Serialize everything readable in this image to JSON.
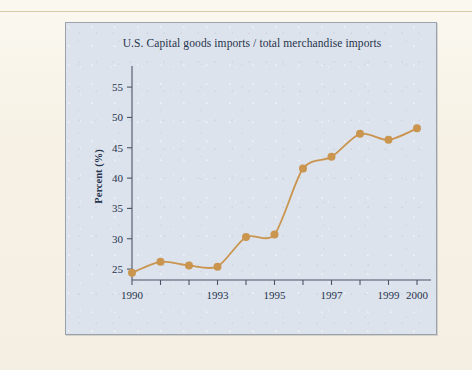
{
  "figure": {
    "title": "U.S. Capital goods imports / total merchandise imports",
    "y_axis_label": "Percent (%)",
    "panel_bg": "#dde3ec",
    "page_bg": "#f6f1e4",
    "axis_color": "#4a5568",
    "text_color": "#26334d"
  },
  "chart_data": {
    "type": "line",
    "title": "U.S. Capital goods imports / total merchandise imports",
    "xlabel": "",
    "ylabel": "Percent (%)",
    "x": [
      1990,
      1991,
      1992,
      1993,
      1994,
      1995,
      1996,
      1997,
      1998,
      1999,
      2000
    ],
    "values": [
      24.4,
      26.2,
      25.6,
      25.4,
      30.3,
      30.7,
      41.6,
      43.5,
      47.3,
      46.3,
      48.2
    ],
    "series": [
      {
        "name": "Capital goods imports share",
        "color": "#c9954f",
        "marker": "circle",
        "values": [
          24.4,
          26.2,
          25.6,
          25.4,
          30.3,
          30.7,
          41.6,
          43.5,
          47.3,
          46.3,
          48.2
        ]
      }
    ],
    "xlim": [
      1990,
      2000
    ],
    "ylim": [
      23.2,
      56.5
    ],
    "yticks": [
      25,
      30,
      35,
      40,
      45,
      50,
      55
    ],
    "ytick_labels": [
      "25",
      "30",
      "35",
      "40",
      "45",
      "50",
      "55"
    ],
    "xticks": [
      1990,
      1991,
      1992,
      1993,
      1994,
      1995,
      1996,
      1997,
      1998,
      1999,
      2000
    ],
    "xtick_labels": [
      "1990",
      "",
      "",
      "1993",
      "",
      "1995",
      "",
      "1997",
      "",
      "1999",
      "2000"
    ],
    "grid": false,
    "legend": "none",
    "line_color": "#c9954f",
    "line_width": 1.8,
    "marker_size": 4
  }
}
